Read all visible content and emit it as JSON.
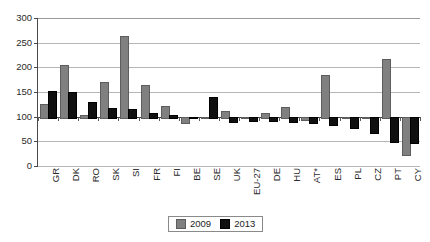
{
  "chart_data": {
    "type": "bar",
    "title": "",
    "subtitle": "",
    "xlabel": "",
    "ylabel": "",
    "ylim": [
      0,
      300
    ],
    "yticks": [
      0,
      50,
      100,
      150,
      200,
      250,
      300
    ],
    "grid": true,
    "baseline": 100,
    "legend_position": "bottom-center",
    "categories": [
      "GR",
      "DK",
      "RO",
      "SK",
      "SI",
      "FR",
      "FI",
      "BE",
      "SE",
      "UK",
      "EU-27",
      "DE",
      "HU",
      "AT*",
      "ES",
      "PL",
      "CZ",
      "PT",
      "CY"
    ],
    "series": [
      {
        "name": "2009",
        "color": "#808080",
        "values": [
          125,
          205,
          104,
          170,
          263,
          164,
          121,
          89,
          100,
          112,
          100,
          108,
          120,
          95,
          185,
          100,
          100,
          216,
          25
        ]
      },
      {
        "name": "2013",
        "color": "#101010",
        "values": [
          152,
          150,
          130,
          117,
          115,
          108,
          104,
          100,
          140,
          91,
          94,
          93,
          92,
          90,
          85,
          80,
          68,
          50,
          48
        ]
      }
    ]
  },
  "axis": {
    "y_tick_labels": [
      "300",
      "250",
      "200",
      "150",
      "100",
      "50",
      "0"
    ]
  },
  "legend": {
    "entries": [
      {
        "label": "2009",
        "swatch": "gray-square-icon"
      },
      {
        "label": "2013",
        "swatch": "black-square-icon"
      }
    ]
  }
}
